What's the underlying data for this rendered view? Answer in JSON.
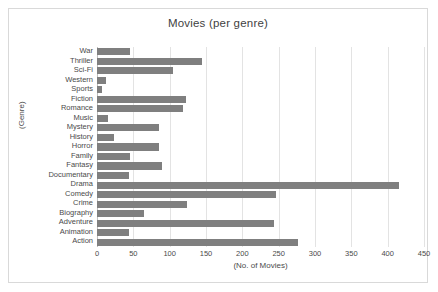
{
  "chart_data": {
    "type": "bar",
    "orientation": "horizontal",
    "title": "Movies (per genre)",
    "xlabel": "(No. of Movies)",
    "ylabel": "(Genre)",
    "xlim": [
      0,
      450
    ],
    "xticks": [
      0,
      50,
      100,
      150,
      200,
      250,
      300,
      350,
      400,
      450
    ],
    "grid": true,
    "legend": null,
    "bar_color": "#7f7f7f",
    "categories": [
      "War",
      "Thriller",
      "Sci-Fi",
      "Western",
      "Sports",
      "Fiction",
      "Romance",
      "Music",
      "Mystery",
      "History",
      "Horror",
      "Family",
      "Fantasy",
      "Documentary",
      "Drama",
      "Comedy",
      "Crime",
      "Biography",
      "Adventure",
      "Animation",
      "Action"
    ],
    "values": [
      45,
      145,
      105,
      12,
      7,
      122,
      118,
      15,
      85,
      23,
      86,
      46,
      89,
      44,
      415,
      247,
      124,
      65,
      243,
      44,
      277
    ]
  }
}
